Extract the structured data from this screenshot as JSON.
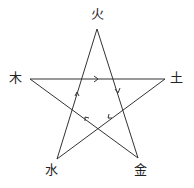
{
  "diagram": {
    "title": "",
    "nodes": [
      {
        "id": "fire",
        "label": "火",
        "x": 97,
        "y": 29,
        "lx": 90,
        "ly": 7
      },
      {
        "id": "wood",
        "label": "木",
        "x": 30,
        "y": 79,
        "lx": 9,
        "ly": 71
      },
      {
        "id": "earth",
        "label": "土",
        "x": 165,
        "ly": 71,
        "lx": 170,
        "y": 79
      },
      {
        "id": "water",
        "label": "水",
        "x": 57,
        "y": 159,
        "lx": 45,
        "ly": 163
      },
      {
        "id": "metal",
        "label": "金",
        "x": 138,
        "y": 158,
        "lx": 134,
        "ly": 163
      }
    ],
    "edges": [
      {
        "from": "wood",
        "to": "earth",
        "arrow_at": [
          97,
          79
        ],
        "direction": "right"
      },
      {
        "from": "fire",
        "to": "metal",
        "arrow_at": [
          118,
          92
        ],
        "direction": "down"
      },
      {
        "from": "earth",
        "to": "water",
        "arrow_at": [
          110,
          117
        ],
        "direction": "down-left"
      },
      {
        "from": "metal",
        "to": "wood",
        "arrow_at": [
          86,
          118
        ],
        "direction": "up-left"
      },
      {
        "from": "water",
        "to": "fire",
        "arrow_at": [
          77,
          93
        ],
        "direction": "up"
      }
    ],
    "line_color": "#333333"
  }
}
